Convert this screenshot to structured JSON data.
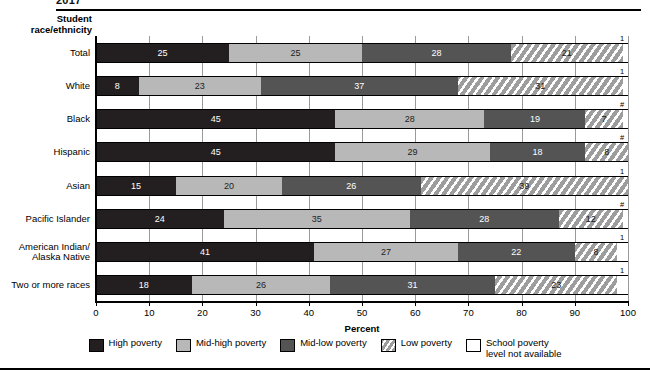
{
  "top_title": "2017",
  "axis_header": "Student\nrace/ethnicity",
  "xlabel": "Percent",
  "tick_labels": [
    "0",
    "10",
    "20",
    "30",
    "40",
    "50",
    "60",
    "70",
    "80",
    "90",
    "100"
  ],
  "legend": [
    {
      "key": "high",
      "label": "High poverty"
    },
    {
      "key": "midhigh",
      "label": "Mid-high poverty"
    },
    {
      "key": "midlow",
      "label": "Mid-low poverty"
    },
    {
      "key": "low",
      "label": "Low poverty"
    },
    {
      "key": "na",
      "label": "School poverty\nlevel not available"
    }
  ],
  "colors": {
    "high": "#231f20",
    "midhigh": "#b8b8b8",
    "midlow": "#545454",
    "low": "#9d9d9d",
    "na": "#ffffff",
    "axis": "#000000",
    "grid": "#9a9a9a"
  },
  "chart_data": {
    "type": "bar",
    "orientation": "horizontal",
    "stacked": true,
    "title": "2017",
    "xlabel": "Percent",
    "ylabel": "Student race/ethnicity",
    "xlim": [
      0,
      100
    ],
    "xticks": [
      0,
      10,
      20,
      30,
      40,
      50,
      60,
      70,
      80,
      90,
      100
    ],
    "grid": true,
    "legend_position": "bottom",
    "categories": [
      "Total",
      "White",
      "Black",
      "Hispanic",
      "Asian",
      "Pacific Islander",
      "American Indian/\nAlaska Native",
      "Two or more races"
    ],
    "series": [
      {
        "name": "High poverty",
        "values": [
          25,
          8,
          45,
          45,
          15,
          24,
          41,
          18
        ]
      },
      {
        "name": "Mid-high poverty",
        "values": [
          25,
          23,
          28,
          29,
          20,
          35,
          27,
          26
        ]
      },
      {
        "name": "Mid-low poverty",
        "values": [
          28,
          37,
          19,
          18,
          26,
          28,
          22,
          31
        ]
      },
      {
        "name": "Low poverty",
        "values": [
          21,
          31,
          7,
          8,
          39,
          12,
          8,
          23
        ]
      },
      {
        "name": "School poverty level not available",
        "values": [
          1,
          1,
          1,
          0,
          0,
          1,
          2,
          2
        ]
      }
    ],
    "row_endnotes": [
      "1",
      "1",
      "#",
      "#",
      "1",
      "#",
      "1",
      "1"
    ],
    "annotations": [
      "Superscript 1 denotes rounds to zero",
      "# denotes rounds to zero"
    ]
  },
  "rows": [
    {
      "label": "Total",
      "segments": [
        25,
        25,
        28,
        21,
        1
      ],
      "endnote": "1"
    },
    {
      "label": "White",
      "segments": [
        8,
        23,
        37,
        31,
        1
      ],
      "endnote": "1"
    },
    {
      "label": "Black",
      "segments": [
        45,
        28,
        19,
        7,
        1
      ],
      "endnote": "#"
    },
    {
      "label": "Hispanic",
      "segments": [
        45,
        29,
        18,
        8,
        0
      ],
      "endnote": "#"
    },
    {
      "label": "Asian",
      "segments": [
        15,
        20,
        26,
        39,
        0
      ],
      "endnote": "1"
    },
    {
      "label": "Pacific Islander",
      "segments": [
        24,
        35,
        28,
        12,
        1
      ],
      "endnote": "#"
    },
    {
      "label": "American Indian/\nAlaska Native",
      "segments": [
        41,
        27,
        22,
        8,
        2
      ],
      "endnote": "1"
    },
    {
      "label": "Two or more races",
      "segments": [
        18,
        26,
        31,
        23,
        2
      ],
      "endnote": "1"
    }
  ]
}
